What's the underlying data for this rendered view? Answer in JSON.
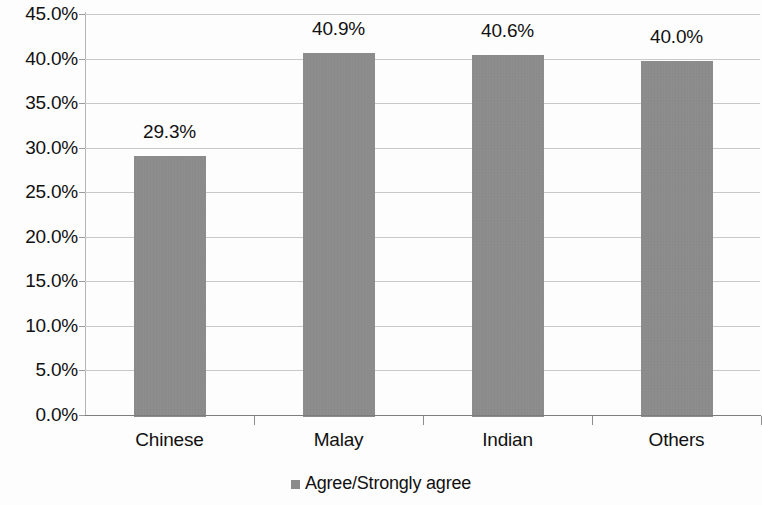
{
  "chart_data": {
    "type": "bar",
    "title": "",
    "subtitle": "",
    "xlabel": "",
    "ylabel": "",
    "categories": [
      "Chinese",
      "Malay",
      "Indian",
      "Others"
    ],
    "values": [
      29.3,
      40.9,
      40.6,
      40.0
    ],
    "data_labels": [
      "29.3%",
      "40.9%",
      "40.6%",
      "40.0%"
    ],
    "series": [
      {
        "name": "Agree/Strongly agree",
        "values": [
          29.3,
          40.9,
          40.6,
          40.0
        ],
        "color": "#8b8b8b"
      }
    ],
    "ylim": [
      0,
      45
    ],
    "ytick_step": 5,
    "ytick_labels": [
      "45.0%",
      "40.0%",
      "35.0%",
      "30.0%",
      "25.0%",
      "20.0%",
      "15.0%",
      "10.0%",
      "5.0%",
      "0.0%"
    ],
    "ytick_values": [
      45,
      40,
      35,
      30,
      25,
      20,
      15,
      10,
      5,
      0
    ],
    "grid": true,
    "grid_axis": "y",
    "legend": {
      "position": "bottom",
      "entries": [
        {
          "label": "Agree/Strongly agree",
          "color": "#8b8b8b"
        }
      ]
    },
    "colors": {
      "bar": "#8b8b8b",
      "gridline": "#c9c9c9",
      "axis": "#8d8d8d",
      "text": "#111111",
      "background": "#fdfdfd"
    }
  }
}
